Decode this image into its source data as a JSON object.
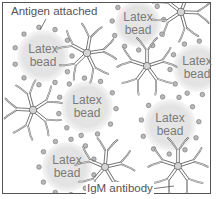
{
  "figure": {
    "type": "diagram",
    "labels": {
      "antigen": "Antigen attached",
      "antibody": "IgM antibody"
    },
    "beads": [
      {
        "cx": 43,
        "cy": 56,
        "r": 26,
        "line1": "Latex",
        "line2": "bead"
      },
      {
        "cx": 138,
        "cy": 24,
        "r": 23,
        "line1": "Latex",
        "line2": "bead"
      },
      {
        "cx": 197,
        "cy": 68,
        "r": 24,
        "line1": "Latex",
        "line2": "bead"
      },
      {
        "cx": 87,
        "cy": 107,
        "r": 26,
        "line1": "Latex",
        "line2": "bead"
      },
      {
        "cx": 170,
        "cy": 125,
        "r": 26,
        "line1": "Latex",
        "line2": "bead"
      },
      {
        "cx": 67,
        "cy": 167,
        "r": 25,
        "line1": "Latex",
        "line2": "bead"
      }
    ],
    "antibodies": [
      {
        "cx": 87,
        "cy": 53,
        "rot": 10
      },
      {
        "cx": 147,
        "cy": 66,
        "rot": 0
      },
      {
        "cx": 181,
        "cy": 12,
        "rot": 20
      },
      {
        "cx": 33,
        "cy": 110,
        "rot": -15
      },
      {
        "cx": 105,
        "cy": 167,
        "rot": 5
      },
      {
        "cx": 178,
        "cy": 166,
        "rot": 0
      }
    ],
    "colors": {
      "background": "#ffffff",
      "frame": "#555555",
      "bead_fill": "#e4e4e4",
      "antigen_fill": "#b8b8b8",
      "antigen_stroke": "#6e6e6e",
      "antibody_stroke": "#6f6f6f",
      "antibody_fill": "#d5d5d5",
      "text": "#6a6a6a"
    }
  }
}
